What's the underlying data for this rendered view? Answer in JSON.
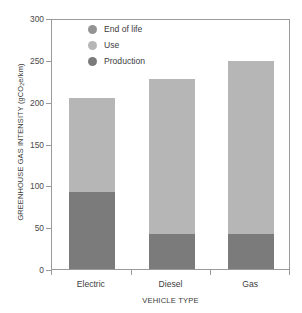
{
  "chart_data": {
    "type": "bar",
    "stacked": true,
    "title": "",
    "xlabel": "VEHICLE TYPE",
    "ylabel": "GREENHOUSE GAS INTENSITY (gCO2e/km)",
    "ylabel_main": "GREENHOUSE GAS INTENSITY (gCO",
    "ylabel_sub": "2",
    "ylabel_tail": "e/km)",
    "categories": [
      "Electric",
      "Diesel",
      "Gas"
    ],
    "series": [
      {
        "name": "Production",
        "values": [
          92,
          42,
          42
        ],
        "color": "#7b7b7b"
      },
      {
        "name": "Use",
        "values": [
          113,
          185,
          207
        ],
        "color": "#b6b6b6"
      },
      {
        "name": "End of life",
        "values": [
          0,
          0,
          0
        ],
        "color": "#949494"
      }
    ],
    "totals": [
      205,
      227,
      249
    ],
    "ylim": [
      0,
      300
    ],
    "yticks": [
      0,
      50,
      100,
      150,
      200,
      250,
      300
    ],
    "ytick_labels": [
      "0",
      "50",
      "100",
      "150",
      "200",
      "250",
      "300"
    ],
    "grid": false,
    "legend_position": "upper-left-inside",
    "legend": [
      {
        "label": "End of life",
        "color": "#949494"
      },
      {
        "label": "Use",
        "color": "#b6b6b6"
      },
      {
        "label": "Production",
        "color": "#7b7b7b"
      }
    ],
    "axis_color": "#9a9a9a",
    "background": "#ffffff"
  }
}
